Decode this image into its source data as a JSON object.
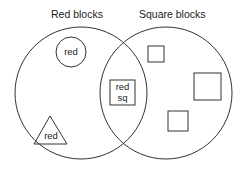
{
  "diagram": {
    "type": "venn",
    "sets": [
      {
        "label": "Red blocks"
      },
      {
        "label": "Square blocks"
      }
    ],
    "items": [
      {
        "shape": "circle",
        "text": "red",
        "region": "Red blocks only"
      },
      {
        "shape": "triangle",
        "text": "red",
        "region": "Red blocks only"
      },
      {
        "shape": "square",
        "text_line1": "red",
        "text_line2": "sq",
        "region": "Intersection"
      },
      {
        "shape": "square",
        "text": "",
        "region": "Square blocks only"
      },
      {
        "shape": "square",
        "text": "",
        "region": "Square blocks only"
      },
      {
        "shape": "square",
        "text": "",
        "region": "Square blocks only"
      }
    ],
    "stroke_color": "#333333"
  }
}
